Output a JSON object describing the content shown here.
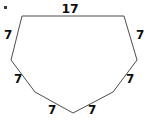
{
  "figure": {
    "type": "polygon-diagram",
    "shape_name": "heptagon",
    "side_count": 7,
    "stroke_color": "#4c4c4c",
    "fill_color": "#ffffff",
    "label_color": "#0d0d0d",
    "background_color": "#ffffff",
    "marker": {
      "name": "corner-dot",
      "color": "#3a3a3a"
    },
    "vertices": [
      {
        "name": "top-left",
        "x": 22,
        "y": 16
      },
      {
        "name": "top-right",
        "x": 124,
        "y": 16
      },
      {
        "name": "right",
        "x": 137,
        "y": 60
      },
      {
        "name": "bottom-right",
        "x": 113,
        "y": 92
      },
      {
        "name": "bottom-apex",
        "x": 73,
        "y": 113
      },
      {
        "name": "bottom-left",
        "x": 35,
        "y": 92
      },
      {
        "name": "left",
        "x": 11,
        "y": 60
      }
    ],
    "side_labels": [
      {
        "name": "side-label-top",
        "value": "17",
        "x": 70,
        "y": 9
      },
      {
        "name": "side-label-upper-left",
        "value": "7",
        "x": 8,
        "y": 35
      },
      {
        "name": "side-label-upper-right",
        "value": "7",
        "x": 140,
        "y": 35
      },
      {
        "name": "side-label-lower-left",
        "value": "7",
        "x": 18,
        "y": 79
      },
      {
        "name": "side-label-lower-right",
        "value": "7",
        "x": 130,
        "y": 79
      },
      {
        "name": "side-label-bottom-left",
        "value": "7",
        "x": 52,
        "y": 110
      },
      {
        "name": "side-label-bottom-right",
        "value": "7",
        "x": 92,
        "y": 110
      }
    ]
  }
}
